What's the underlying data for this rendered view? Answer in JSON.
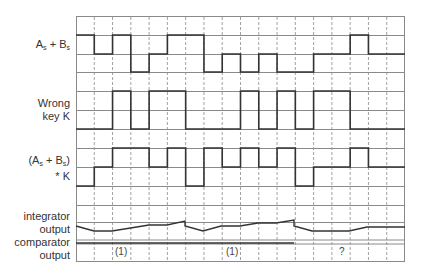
{
  "diagram": {
    "type": "timing-diagram",
    "grid": {
      "x0": 76,
      "x1": 405,
      "columns": 18,
      "line_color": "#8a8a8a",
      "signal_color": "#333333"
    },
    "labels": {
      "as_bs": {
        "a": "A",
        "a_sub": "s",
        "plus": " + ",
        "b": "B",
        "b_sub": "s"
      },
      "wrong_key": {
        "line1": "Wrong",
        "line2": "key K"
      },
      "product": {
        "open": "(A",
        "a_sub": "s",
        "plus": " + B",
        "b_sub": "s",
        "close": ")",
        "line2": "* K"
      },
      "integrator": {
        "line1": "integrator",
        "line2": "output"
      },
      "comparator": {
        "line1": "comparator",
        "line2": "output"
      }
    },
    "signals": {
      "as_bs": [
        35,
        54,
        35,
        72,
        54,
        35,
        35,
        72,
        54,
        72,
        54,
        72,
        72,
        54,
        54,
        35,
        54,
        54
      ],
      "wrong_key": [
        129,
        129,
        91,
        129,
        91,
        91,
        129,
        129,
        129,
        91,
        129,
        91,
        129,
        91,
        91,
        129,
        129,
        129
      ],
      "product": [
        186,
        167,
        148,
        148,
        167,
        148,
        186,
        148,
        167,
        148,
        167,
        148,
        186,
        167,
        167,
        148,
        167,
        167
      ]
    },
    "annotations": [
      {
        "text": "(1)",
        "x": 115,
        "y": 247
      },
      {
        "text": "(1)",
        "x": 226,
        "y": 247
      },
      {
        "text": "?",
        "x": 339,
        "y": 247
      }
    ]
  }
}
